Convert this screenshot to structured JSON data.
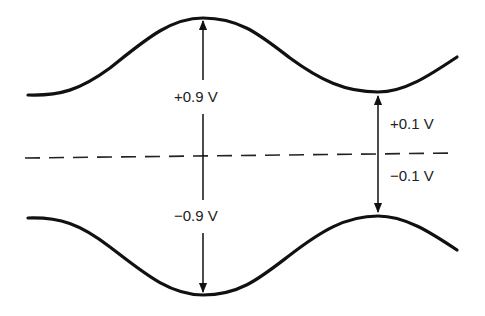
{
  "diagram": {
    "type": "modulated-waveform-envelope",
    "colors": {
      "stroke": "#111111",
      "text": "#222222",
      "background": "#ffffff"
    },
    "upper_envelope": {
      "max_label": "+0.9 V",
      "min_label": "+0.1 V"
    },
    "lower_envelope": {
      "max_label": "−0.9 V",
      "min_label": "−0.1 V"
    },
    "reference_line": {
      "style": "dashed",
      "meaning": "zero axis"
    },
    "labels": {
      "peak_positive": "+0.9 V",
      "peak_negative": "−0.9 V",
      "trough_positive": "+0.1 V",
      "trough_negative": "−0.1 V"
    }
  }
}
